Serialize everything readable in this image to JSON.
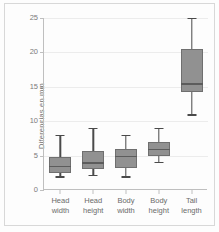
{
  "chart_data": {
    "type": "box",
    "title": "",
    "xlabel": "",
    "ylabel": "Diferencias en mm",
    "ylim": [
      0,
      25
    ],
    "yticks": [
      0,
      5,
      10,
      15,
      20,
      25
    ],
    "grid": true,
    "legend": "none",
    "categories": [
      "Head width",
      "Head height",
      "Body width",
      "Body height",
      "Tail length"
    ],
    "category_lines": [
      [
        "Head",
        "width"
      ],
      [
        "Head",
        "height"
      ],
      [
        "Body",
        "width"
      ],
      [
        "Body",
        "height"
      ],
      [
        "Tail",
        "length"
      ]
    ],
    "boxes": [
      {
        "label": "Head width",
        "min": 2.0,
        "q1": 2.5,
        "median": 3.5,
        "q3": 4.8,
        "max": 8.0
      },
      {
        "label": "Head height",
        "min": 2.2,
        "q1": 3.0,
        "median": 4.0,
        "q3": 5.7,
        "max": 9.0
      },
      {
        "label": "Body width",
        "min": 2.0,
        "q1": 3.2,
        "median": 5.0,
        "q3": 6.0,
        "max": 8.0
      },
      {
        "label": "Body height",
        "min": 4.1,
        "q1": 5.0,
        "median": 6.0,
        "q3": 7.0,
        "max": 9.0
      },
      {
        "label": "Tail length",
        "min": 11.0,
        "q1": 14.3,
        "median": 15.5,
        "q3": 20.5,
        "max": 25.0
      }
    ],
    "colors": {
      "box_fill": "#919191",
      "box_stroke": "#6f6f6f",
      "median": "#5c5c5c",
      "whisker": "#4a4a4a",
      "grid": "#ececec",
      "axis": "#bfbfbf",
      "tick_text": "#7a7a7a",
      "background": "#fdfdfd"
    }
  }
}
